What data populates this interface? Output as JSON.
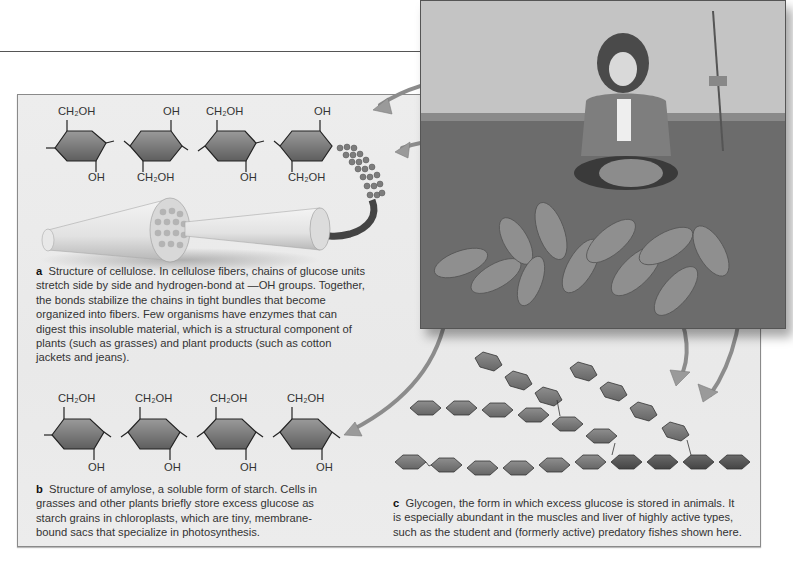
{
  "figure": {
    "panel_a": {
      "label": "a",
      "caption": "Structure of cellulose. In cellulose fibers, chains of glucose units stretch side by side and hydrogen-bond at —OH groups. Together, the bonds stabilize the chains in tight bundles that become organized into fibers. Few organisms have enzymes that can digest this insoluble material, which is a structural component of plants (such as grasses) and plant products (such as cotton jackets and jeans).",
      "top_labels": [
        "CH₂OH",
        "OH",
        "CH₂OH",
        "OH"
      ],
      "bottom_labels": [
        "OH",
        "CH₂OH",
        "OH",
        "CH₂OH"
      ],
      "ring_oxygen": "O",
      "bridge_oxygen": "O"
    },
    "panel_b": {
      "label": "b",
      "caption": "Structure of amylose, a soluble form of starch. Cells in grasses and other plants briefly store excess glucose as starch grains in chloroplasts, which are tiny, membrane-bound sacs that specialize in photosynthesis.",
      "top_labels": [
        "CH₂OH",
        "CH₂OH",
        "CH₂OH",
        "CH₂OH"
      ],
      "bottom_labels": [
        "OH",
        "OH",
        "OH",
        "OH"
      ],
      "ring_oxygen": "O",
      "bridge_oxygen": "O"
    },
    "panel_c": {
      "label": "c",
      "caption": "Glycogen, the form in which excess glucose is stored in animals. It is especially abundant in the muscles and liver of highly active types, such as the student and (formerly active) predatory fishes shown here."
    },
    "photo": {
      "description": "Student kneeling on grass holding a fish, with a pile of fishes in front and a fishing rod behind"
    },
    "colors": {
      "ring_fill": "#7a7a7a",
      "ring_dark": "#4a4a4a",
      "panel_bg": "#ebebeb",
      "arrow": "#9a9a9a"
    }
  }
}
